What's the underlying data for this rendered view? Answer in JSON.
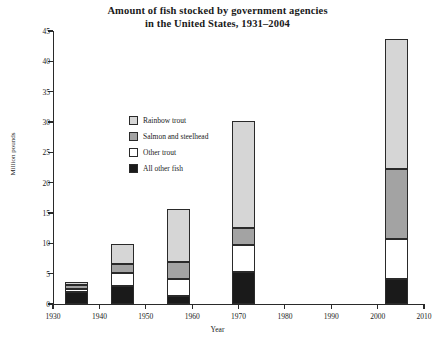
{
  "chart_data": {
    "type": "bar",
    "stacked": true,
    "title": "Amount of fish stocked by government agencies in the United States, 1931–2004",
    "title_lines": [
      "Amount of fish stocked by government agencies",
      "in the United States, 1931–2004"
    ],
    "xlabel": "Year",
    "ylabel": "Million pounds",
    "xlim": [
      1930,
      2010
    ],
    "ylim": [
      0,
      45
    ],
    "ytick_labels": [
      "0",
      "5",
      "10",
      "15",
      "20",
      "25",
      "30",
      "35",
      "40",
      "45"
    ],
    "yticks": [
      0,
      5,
      10,
      15,
      20,
      25,
      30,
      35,
      40,
      45
    ],
    "xtick_labels": [
      "1930",
      "1940",
      "1950",
      "1960",
      "1970",
      "1980",
      "1990",
      "2000",
      "2010"
    ],
    "xticks": [
      1930,
      1940,
      1950,
      1960,
      1970,
      1980,
      1990,
      2000,
      2010
    ],
    "grid": false,
    "legend_position": "upper-left-inside",
    "x": [
      1935,
      1945,
      1957,
      1971,
      2004
    ],
    "bar_width_years": 5.0,
    "series": [
      {
        "name": "All other fish",
        "color": "#1a1a1a",
        "values": [
          1.9,
          2.9,
          1.4,
          5.2,
          4.1
        ]
      },
      {
        "name": "Other trout",
        "color": "#ffffff",
        "values": [
          0.6,
          2.2,
          2.8,
          4.6,
          6.6
        ]
      },
      {
        "name": "Salmon and steelhead",
        "color": "#a3a3a3",
        "values": [
          0.7,
          1.5,
          2.7,
          2.7,
          11.6
        ]
      },
      {
        "name": "Rainbow trout",
        "color": "#d6d6d6",
        "values": [
          0.5,
          3.3,
          8.8,
          17.7,
          21.3
        ]
      }
    ],
    "totals": [
      3.7,
      9.9,
      15.7,
      30.2,
      43.6
    ],
    "legend_order": [
      "Rainbow trout",
      "Salmon and steelhead",
      "Other trout",
      "All other fish"
    ]
  },
  "legend": {
    "items": [
      {
        "label": "Rainbow trout",
        "color": "#d6d6d6"
      },
      {
        "label": "Salmon and steelhead",
        "color": "#a3a3a3"
      },
      {
        "label": "Other trout",
        "color": "#ffffff"
      },
      {
        "label": "All other fish",
        "color": "#1a1a1a"
      }
    ]
  }
}
